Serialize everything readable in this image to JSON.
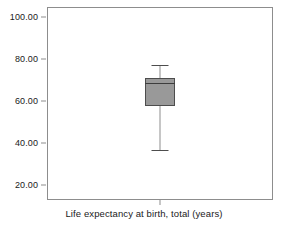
{
  "chart_data": {
    "type": "box",
    "title": "",
    "subtitle": "",
    "xlabel": "Life expectancy at birth, total (years)",
    "ylabel": "",
    "categories": [
      "Life expectancy at birth, total (years)"
    ],
    "ylim": [
      13,
      105
    ],
    "yticks": [
      20,
      40,
      60,
      80,
      100
    ],
    "ytick_labels": [
      "20.00",
      "40.00",
      "60.00",
      "80.00",
      "100.00"
    ],
    "grid": false,
    "legend": "none",
    "boxes": [
      {
        "name": "Life expectancy at birth, total (years)",
        "whisker_low": 37,
        "q1": 58,
        "median": 69,
        "q3": 71,
        "whisker_high": 77.5,
        "outliers": [],
        "fill_color": "#999999",
        "line_color": "#4d4d4d"
      }
    ]
  },
  "axes": {
    "y_ticks": [
      {
        "label": "100.00",
        "value": 100
      },
      {
        "label": "80.00",
        "value": 80
      },
      {
        "label": "60.00",
        "value": 60
      },
      {
        "label": "40.00",
        "value": 40
      },
      {
        "label": "20.00",
        "value": 20
      }
    ],
    "x_title": "Life expectancy at birth, total (years)"
  },
  "colors": {
    "frame": "#8d8d8d",
    "box_fill": "#999999",
    "box_outline": "#4d4d4d",
    "median": "#3d3d3d",
    "whisker": "#8d8d8d",
    "text": "#1a1a1a",
    "background": "#ffffff"
  }
}
